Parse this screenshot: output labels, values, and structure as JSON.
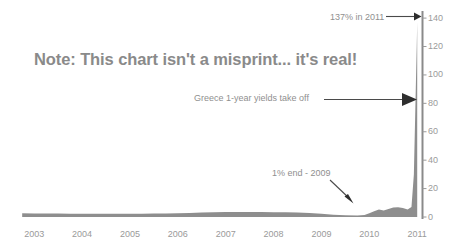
{
  "chart_data": {
    "type": "area",
    "title": "Note: This chart isn't a misprint... it's real!",
    "xlabel": "",
    "ylabel": "",
    "xlim": [
      2002.6,
      2011.1
    ],
    "ylim": [
      0,
      145
    ],
    "grid": false,
    "legend": null,
    "series_name": "Greece 1-year government bond yield (%)",
    "y_ticks": [
      {
        "value": 140,
        "label": "140"
      },
      {
        "value": 120,
        "label": "120"
      },
      {
        "value": 100,
        "label": "100"
      },
      {
        "value": 80,
        "label": "80"
      },
      {
        "value": 60,
        "label": "60"
      },
      {
        "value": 40,
        "label": "40"
      },
      {
        "value": 20,
        "label": "20"
      },
      {
        "value": 0,
        "label": "0"
      }
    ],
    "x_ticks": [
      {
        "value": 2003,
        "label": "2003"
      },
      {
        "value": 2004,
        "label": "2004"
      },
      {
        "value": 2005,
        "label": "2005"
      },
      {
        "value": 2006,
        "label": "2006"
      },
      {
        "value": 2007,
        "label": "2007"
      },
      {
        "value": 2008,
        "label": "2008"
      },
      {
        "value": 2009,
        "label": "2009"
      },
      {
        "value": 2010,
        "label": "2010"
      },
      {
        "value": 2011,
        "label": "2011"
      }
    ],
    "x": [
      2002.75,
      2003.0,
      2003.25,
      2003.5,
      2003.75,
      2004.0,
      2004.25,
      2004.5,
      2004.75,
      2005.0,
      2005.25,
      2005.5,
      2005.75,
      2006.0,
      2006.25,
      2006.5,
      2006.75,
      2007.0,
      2007.25,
      2007.5,
      2007.75,
      2008.0,
      2008.25,
      2008.5,
      2008.75,
      2009.0,
      2009.25,
      2009.5,
      2009.75,
      2009.9,
      2010.0,
      2010.1,
      2010.2,
      2010.3,
      2010.4,
      2010.5,
      2010.6,
      2010.7,
      2010.8,
      2010.88,
      2010.93,
      2010.96,
      2010.99,
      2011.0
    ],
    "values": [
      2.6,
      2.5,
      2.4,
      2.4,
      2.3,
      2.3,
      2.2,
      2.2,
      2.2,
      2.3,
      2.3,
      2.4,
      2.5,
      2.7,
      2.9,
      3.1,
      3.3,
      3.5,
      3.6,
      3.6,
      3.5,
      3.4,
      3.3,
      3.2,
      2.9,
      2.2,
      1.6,
      1.2,
      1.0,
      1.4,
      2.6,
      4.0,
      5.2,
      4.6,
      5.6,
      6.6,
      6.8,
      6.4,
      5.2,
      7.0,
      30.0,
      75.0,
      120.0,
      137.0
    ],
    "annotations": [
      {
        "id": "peak",
        "text": "137% in 2011",
        "marker": "arrow-right",
        "points_to_value": 137,
        "points_to_year": 2011
      },
      {
        "id": "takeoff",
        "text": "Greece 1-year yields take off",
        "marker": "arrow-right",
        "points_to_value": 80,
        "points_to_year": 2011
      },
      {
        "id": "end-2009",
        "text": "1% end - 2009",
        "marker": "arrow-down-right",
        "points_to_value": 1,
        "points_to_year": 2009.75
      }
    ],
    "colors": {
      "area_fill": "#8e8e8e",
      "axis": "#8a8a8a",
      "text": "#8f8f8f",
      "title_text": "#8a8a8a",
      "background": "#ffffff"
    }
  }
}
